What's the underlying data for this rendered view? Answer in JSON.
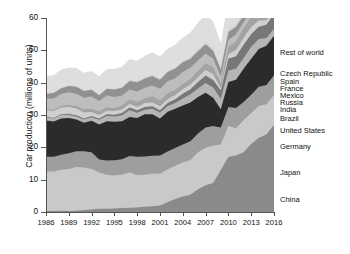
{
  "chart_data": {
    "type": "area",
    "stacked": true,
    "title": "",
    "xlabel": "",
    "ylabel": "Car production (millions of units)",
    "ylim": [
      0,
      60
    ],
    "xlim": [
      1986,
      2016
    ],
    "yticks": [
      0,
      10,
      20,
      30,
      40,
      50,
      60
    ],
    "xticks": [
      1986,
      1989,
      1992,
      1995,
      1998,
      2001,
      2004,
      2007,
      2010,
      2013,
      2016
    ],
    "grid": false,
    "legend_position": "right",
    "x": [
      1986,
      1987,
      1988,
      1989,
      1990,
      1991,
      1992,
      1993,
      1994,
      1995,
      1996,
      1997,
      1998,
      1999,
      2000,
      2001,
      2002,
      2003,
      2004,
      2005,
      2006,
      2007,
      2008,
      2009,
      2010,
      2011,
      2012,
      2013,
      2014,
      2015,
      2016
    ],
    "series": [
      {
        "name": "China",
        "color": "#8a8a8a",
        "values": [
          0.3,
          0.3,
          0.4,
          0.3,
          0.4,
          0.6,
          0.8,
          1.0,
          1.0,
          1.1,
          1.2,
          1.3,
          1.4,
          1.6,
          1.8,
          2.0,
          3.0,
          4.0,
          4.8,
          5.3,
          7.0,
          8.3,
          9.0,
          13.0,
          17.0,
          17.5,
          18.5,
          21.0,
          23.0,
          24.0,
          27.0
        ]
      },
      {
        "name": "Japan",
        "color": "#c9c9c9",
        "values": [
          12.2,
          12.2,
          12.7,
          13.0,
          13.5,
          13.2,
          12.5,
          11.2,
          10.5,
          10.2,
          10.3,
          11.0,
          10.0,
          9.9,
          10.1,
          9.8,
          10.2,
          10.3,
          10.5,
          10.8,
          11.5,
          11.6,
          11.6,
          7.9,
          9.6,
          8.4,
          9.9,
          9.6,
          9.8,
          9.3,
          9.2
        ]
      },
      {
        "name": "Germany",
        "color": "#9e9e9e",
        "values": [
          4.6,
          4.6,
          4.6,
          4.9,
          4.9,
          5.0,
          5.2,
          4.0,
          4.4,
          4.7,
          4.8,
          5.0,
          5.7,
          5.7,
          5.5,
          5.7,
          5.5,
          5.5,
          5.6,
          5.8,
          5.8,
          6.2,
          6.0,
          5.2,
          5.9,
          6.3,
          5.6,
          5.7,
          5.9,
          6.0,
          6.1
        ]
      },
      {
        "name": "United States",
        "color": "#2b2b2b",
        "values": [
          11.2,
          10.9,
          11.2,
          10.9,
          9.8,
          8.8,
          9.7,
          10.9,
          12.2,
          11.9,
          11.8,
          12.1,
          12.0,
          13.0,
          12.8,
          11.4,
          12.3,
          12.1,
          12.0,
          12.0,
          11.3,
          10.8,
          8.7,
          5.7,
          7.7,
          8.7,
          10.3,
          11.1,
          11.7,
          12.1,
          12.2
        ]
      },
      {
        "name": "Brazil",
        "color": "#b5b5b5",
        "values": [
          1.0,
          0.9,
          1.1,
          1.0,
          0.9,
          1.0,
          1.1,
          1.4,
          1.6,
          1.6,
          1.8,
          2.1,
          1.6,
          1.4,
          1.7,
          1.8,
          1.8,
          1.8,
          2.2,
          2.5,
          2.6,
          3.0,
          3.2,
          3.2,
          3.6,
          3.4,
          3.3,
          3.7,
          3.1,
          2.4,
          2.2
        ]
      },
      {
        "name": "India",
        "color": "#777777",
        "values": [
          0.2,
          0.2,
          0.2,
          0.3,
          0.4,
          0.3,
          0.4,
          0.4,
          0.5,
          0.6,
          0.7,
          0.8,
          0.8,
          0.9,
          0.8,
          0.8,
          0.9,
          1.2,
          1.5,
          1.6,
          2.0,
          2.3,
          2.3,
          2.6,
          3.6,
          3.9,
          4.1,
          3.9,
          3.8,
          4.1,
          4.5
        ]
      },
      {
        "name": "Russia",
        "color": "#cfcfcf",
        "values": [
          2.1,
          2.1,
          2.1,
          2.1,
          2.1,
          1.9,
          1.2,
          1.1,
          1.1,
          1.1,
          1.1,
          1.2,
          1.0,
          1.2,
          1.2,
          1.2,
          1.2,
          1.3,
          1.4,
          1.4,
          1.5,
          1.7,
          1.8,
          0.7,
          1.4,
          1.9,
          2.2,
          2.2,
          1.9,
          1.4,
          1.3
        ]
      },
      {
        "name": "Mexico",
        "color": "#a3a3a3",
        "values": [
          0.3,
          0.4,
          0.5,
          0.6,
          0.8,
          0.9,
          1.0,
          1.1,
          1.1,
          0.9,
          1.2,
          1.4,
          1.5,
          1.5,
          1.9,
          1.8,
          1.8,
          1.6,
          1.6,
          1.7,
          2.0,
          2.1,
          2.2,
          1.6,
          2.3,
          2.6,
          3.0,
          3.1,
          3.4,
          3.6,
          3.6
        ]
      },
      {
        "name": "France",
        "color": "#bdbdbd",
        "values": [
          3.2,
          3.5,
          3.7,
          3.9,
          3.8,
          3.6,
          3.8,
          3.2,
          3.6,
          3.5,
          3.1,
          3.0,
          3.3,
          3.2,
          3.3,
          3.6,
          3.7,
          3.6,
          3.7,
          3.5,
          3.2,
          3.0,
          2.6,
          2.0,
          2.2,
          2.2,
          1.9,
          1.7,
          1.8,
          2.0,
          2.1
        ]
      },
      {
        "name": "Spain",
        "color": "#919191",
        "values": [
          1.4,
          1.7,
          1.8,
          2.0,
          2.1,
          2.1,
          2.1,
          1.8,
          2.1,
          2.3,
          2.4,
          2.6,
          2.8,
          2.9,
          3.0,
          2.8,
          2.9,
          3.0,
          3.0,
          2.8,
          2.8,
          2.9,
          2.5,
          2.2,
          2.4,
          2.4,
          2.0,
          2.2,
          2.4,
          2.7,
          2.9
        ]
      },
      {
        "name": "Czech Republic",
        "color": "#d6d6d6",
        "values": [
          0.2,
          0.2,
          0.2,
          0.2,
          0.2,
          0.2,
          0.2,
          0.2,
          0.2,
          0.2,
          0.3,
          0.4,
          0.4,
          0.4,
          0.5,
          0.5,
          0.4,
          0.4,
          0.4,
          0.6,
          0.9,
          0.9,
          0.9,
          0.9,
          1.1,
          1.2,
          1.2,
          1.1,
          1.3,
          1.3,
          1.3
        ]
      },
      {
        "name": "Rest of world",
        "color": "#dedede",
        "values": [
          5.4,
          5.3,
          5.6,
          5.5,
          5.6,
          5.5,
          5.6,
          5.7,
          5.9,
          6.1,
          6.2,
          6.4,
          6.3,
          6.6,
          6.8,
          6.7,
          6.8,
          7.0,
          7.2,
          7.5,
          7.9,
          8.4,
          8.1,
          7.3,
          8.6,
          8.9,
          9.1,
          9.5,
          9.8,
          10.1,
          10.4
        ]
      }
    ]
  },
  "legend": {
    "entries": [
      {
        "label": "Rest of world",
        "y": 53
      },
      {
        "label": "Czech Republic",
        "y": 74
      },
      {
        "label": "Spain",
        "y": 82
      },
      {
        "label": "France",
        "y": 89
      },
      {
        "label": "Mexico",
        "y": 96
      },
      {
        "label": "Russia",
        "y": 103
      },
      {
        "label": "India",
        "y": 110
      },
      {
        "label": "Brazil",
        "y": 119
      },
      {
        "label": "United States",
        "y": 131
      },
      {
        "label": "Germany",
        "y": 147
      },
      {
        "label": "Japan",
        "y": 173
      },
      {
        "label": "China",
        "y": 200
      }
    ]
  }
}
